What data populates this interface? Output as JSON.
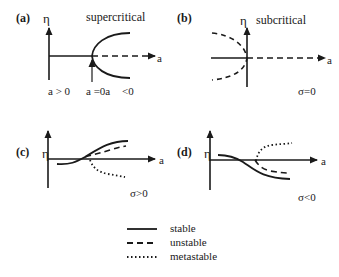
{
  "panels": {
    "a": {
      "label": "(a)",
      "y_axis": "η",
      "x_axis": "a",
      "title": "supercritical",
      "annotations": [
        "a > 0",
        "a =0a",
        "<0"
      ]
    },
    "b": {
      "label": "(b)",
      "y_axis": "η",
      "x_axis": "a",
      "title": "subcritical",
      "condition": "σ=0"
    },
    "c": {
      "label": "(c)",
      "y_axis": "η",
      "x_axis": "a",
      "condition": "σ>0"
    },
    "d": {
      "label": "(d)",
      "y_axis": "η",
      "x_axis": "a",
      "condition": "σ<0"
    }
  },
  "legend": {
    "items": [
      {
        "style": "solid",
        "label": "stable"
      },
      {
        "style": "dashed",
        "label": "unstable"
      },
      {
        "style": "dotted",
        "label": "metastable"
      }
    ]
  },
  "colors": {
    "line": "#1a1a1a",
    "background": "#ffffff"
  }
}
